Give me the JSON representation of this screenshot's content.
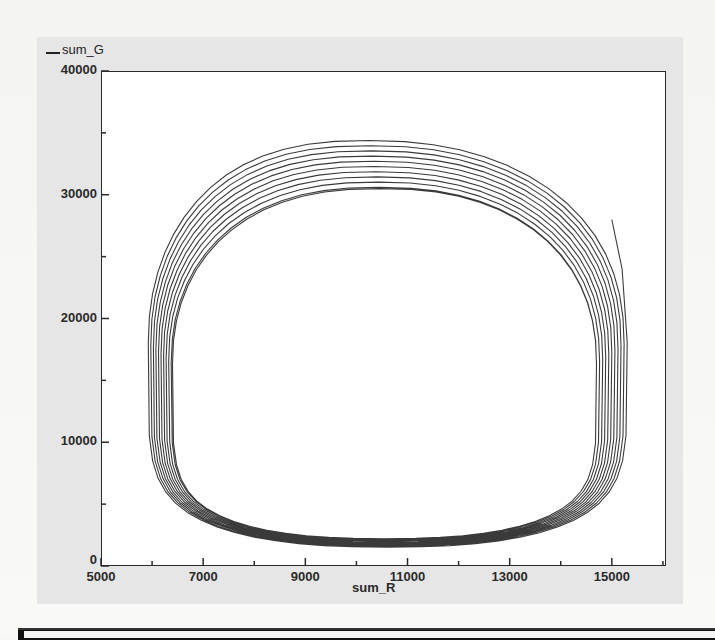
{
  "chart_data": {
    "type": "line",
    "subtype": "phase-portrait",
    "title": "",
    "xlabel": "sum_R",
    "ylabel": "",
    "legend": [
      {
        "name": "sum_G",
        "color": "#222222"
      }
    ],
    "legend_position": "top-left",
    "xlim": [
      5000,
      16060
    ],
    "ylim": [
      0,
      40000
    ],
    "grid": false,
    "x_ticks_major": [
      5000,
      7000,
      9000,
      11000,
      13000,
      15000
    ],
    "x_ticks_minor": [
      6000,
      8000,
      10000,
      12000,
      14000,
      16000
    ],
    "y_ticks_major": [
      0,
      10000,
      20000,
      30000,
      40000
    ],
    "y_ticks_minor": [
      5000,
      15000,
      25000,
      35000
    ],
    "series": [
      {
        "name": "sum_G",
        "description": "Trajectory spiralling inward toward a limit cycle (~11 loops)",
        "start_point": {
          "x": 15000,
          "y": 28000
        },
        "loop_count": 11,
        "outer_loop": {
          "right_x": 15300,
          "left_x": 5900,
          "top_y": 34700,
          "top_x": 10000,
          "bottom_y": 1500,
          "bottom_x": 9800
        },
        "inner_loop": {
          "right_x": 14700,
          "left_x": 6400,
          "top_y": 30500,
          "top_x": 10400,
          "bottom_y": 2200,
          "bottom_x": 10000
        },
        "keypoints_outer": [
          {
            "x": 15000,
            "y": 28000
          },
          {
            "x": 15200,
            "y": 24000
          },
          {
            "x": 15300,
            "y": 14000
          },
          {
            "x": 15100,
            "y": 9000
          },
          {
            "x": 14200,
            "y": 5000
          },
          {
            "x": 12500,
            "y": 2700
          },
          {
            "x": 10500,
            "y": 1800
          },
          {
            "x": 8700,
            "y": 1900
          },
          {
            "x": 7200,
            "y": 3600
          },
          {
            "x": 6300,
            "y": 6800
          },
          {
            "x": 5900,
            "y": 11000
          },
          {
            "x": 6000,
            "y": 15500
          },
          {
            "x": 6500,
            "y": 21000
          },
          {
            "x": 7400,
            "y": 27000
          },
          {
            "x": 8600,
            "y": 31500
          },
          {
            "x": 10000,
            "y": 34700
          },
          {
            "x": 11500,
            "y": 33800
          },
          {
            "x": 12900,
            "y": 30000
          },
          {
            "x": 14000,
            "y": 24500
          },
          {
            "x": 14800,
            "y": 18000
          },
          {
            "x": 15000,
            "y": 13000
          }
        ],
        "keypoints_inner": [
          {
            "x": 14700,
            "y": 13000
          },
          {
            "x": 14500,
            "y": 8500
          },
          {
            "x": 13800,
            "y": 5200
          },
          {
            "x": 12400,
            "y": 3000
          },
          {
            "x": 10500,
            "y": 2300
          },
          {
            "x": 8800,
            "y": 2300
          },
          {
            "x": 7500,
            "y": 3800
          },
          {
            "x": 6700,
            "y": 7000
          },
          {
            "x": 6400,
            "y": 11000
          },
          {
            "x": 6600,
            "y": 16000
          },
          {
            "x": 7200,
            "y": 21500
          },
          {
            "x": 8200,
            "y": 26500
          },
          {
            "x": 9400,
            "y": 29700
          },
          {
            "x": 10400,
            "y": 30500
          },
          {
            "x": 11600,
            "y": 29600
          },
          {
            "x": 12800,
            "y": 26000
          },
          {
            "x": 13800,
            "y": 21500
          },
          {
            "x": 14500,
            "y": 17000
          },
          {
            "x": 14700,
            "y": 13000
          }
        ]
      }
    ]
  },
  "legend": {
    "label": "sum_G"
  },
  "axes": {
    "x_title": "sum_R",
    "y_tick_labels": [
      "40000",
      "30000",
      "20000",
      "10000",
      "0"
    ],
    "x_tick_labels": [
      "5000",
      "7000",
      "9000",
      "11000",
      "13000",
      "15000"
    ]
  },
  "colors": {
    "line": "#3a3a3a",
    "panel": "#e6e6e6",
    "plot_bg": "#ffffff",
    "axis": "#2a2a2a"
  }
}
